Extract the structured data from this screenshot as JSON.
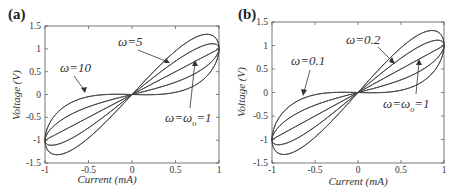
{
  "chart_data": [
    {
      "panel": "(a)",
      "type": "line",
      "title": "",
      "xlabel": "Current  (mA)",
      "ylabel": "Voltage  (V)",
      "xlim": [
        -1,
        1
      ],
      "ylim": [
        -1.5,
        1.5
      ],
      "xticks": [
        "-1",
        "-0.5",
        "0",
        "0.5",
        "1"
      ],
      "yticks": [
        "1.5",
        "1",
        "0.5",
        "0",
        "-0.5",
        "-1",
        "-1.5"
      ],
      "grid": false,
      "annotations": [
        {
          "text": "ω=10",
          "target": "outermost loop (lower/flat branch near I=-0.5)"
        },
        {
          "text": "ω=5",
          "target": "outer loop upper branch near I=0.5"
        },
        {
          "text": "ω=ω",
          "sub": "o",
          "suffix": "=1",
          "target": "inner loop near I=0.7"
        }
      ],
      "series": [
        {
          "name": "loop-1 (outermost)",
          "x": [
            0,
            0.25,
            0.5,
            0.75,
            0.85,
            1
          ],
          "upper": [
            0,
            0.45,
            0.85,
            1.2,
            1.28,
            1.0
          ],
          "lower": [
            0,
            0.01,
            0.08,
            0.3,
            0.5,
            1.0
          ]
        },
        {
          "name": "loop-2",
          "x": [
            0,
            0.25,
            0.5,
            0.75,
            0.9,
            1
          ],
          "upper": [
            0,
            0.35,
            0.7,
            1.0,
            1.08,
            1.0
          ],
          "lower": [
            0,
            0.12,
            0.28,
            0.55,
            0.75,
            1.0
          ]
        },
        {
          "name": "loop-3 (center line)",
          "x": [
            0,
            0.5,
            1
          ],
          "upper": [
            0,
            0.5,
            1.0
          ],
          "lower": [
            0,
            0.5,
            1.0
          ]
        }
      ]
    },
    {
      "panel": "(b)",
      "type": "line",
      "title": "",
      "xlabel": "Current  (mA)",
      "ylabel": "Voltage (V)",
      "xlim": [
        -1,
        1
      ],
      "ylim": [
        -1.5,
        1.5
      ],
      "xticks": [
        "-1",
        "-0.5",
        "0",
        "0.5",
        "1"
      ],
      "yticks": [
        "1.5",
        "1",
        "0.5",
        "0",
        "-0.5",
        "-1",
        "-1.5"
      ],
      "grid": false,
      "annotations": [
        {
          "text": "ω=0.1",
          "target": "outermost loop (lower/flat branch near I=-0.6)"
        },
        {
          "text": "ω=0.2",
          "target": "outer loop upper branch near I=0.5"
        },
        {
          "text": "ω=ω",
          "sub": "o",
          "suffix": "=1",
          "target": "inner loop near I=0.7"
        }
      ],
      "series": [
        {
          "name": "loop-1 (outermost)",
          "x": [
            0,
            0.25,
            0.5,
            0.75,
            0.85,
            1
          ],
          "upper": [
            0,
            0.45,
            0.85,
            1.2,
            1.28,
            1.0
          ],
          "lower": [
            0,
            0.01,
            0.08,
            0.3,
            0.5,
            1.0
          ]
        },
        {
          "name": "loop-2",
          "x": [
            0,
            0.25,
            0.5,
            0.75,
            0.9,
            1
          ],
          "upper": [
            0,
            0.35,
            0.7,
            1.0,
            1.08,
            1.0
          ],
          "lower": [
            0,
            0.12,
            0.28,
            0.55,
            0.75,
            1.0
          ]
        },
        {
          "name": "loop-3 (center line)",
          "x": [
            0,
            0.5,
            1
          ],
          "upper": [
            0,
            0.5,
            1.0
          ],
          "lower": [
            0,
            0.5,
            1.0
          ]
        }
      ]
    }
  ],
  "panels": {
    "a": {
      "label": "(a)",
      "xlabel": "Current  (mA)",
      "ylabel": "Voltage  (V)",
      "ann1": "ω=10",
      "ann2": "ω=5",
      "ann3_main": "ω=ω",
      "ann3_sub": "o",
      "ann3_tail": "=1"
    },
    "b": {
      "label": "(b)",
      "xlabel": "Current  (mA)",
      "ylabel": "Voltage (V)",
      "ann1": "ω=0.1",
      "ann2": "ω=0.2",
      "ann3_main": "ω=ω",
      "ann3_sub": "o",
      "ann3_tail": "=1"
    },
    "xticks": [
      "-1",
      "-0.5",
      "0",
      "0.5",
      "1"
    ],
    "yticks": [
      "1.5",
      "1",
      "0.5",
      "0",
      "-0.5",
      "-1",
      "-1.5"
    ]
  }
}
